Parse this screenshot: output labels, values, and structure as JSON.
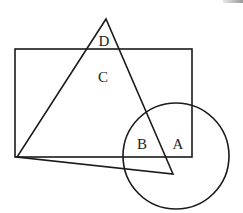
{
  "diagram": {
    "type": "venn-geometric-shapes",
    "stroke_color": "#1a1a1a",
    "background": "#ffffff",
    "shapes": {
      "rectangle": {
        "x": 15,
        "y": 49,
        "width": 177,
        "height": 108
      },
      "triangle": {
        "points": "106,19 17,157 173,174"
      },
      "circle": {
        "cx": 176,
        "cy": 156,
        "r": 53
      }
    },
    "labels": {
      "A": {
        "text": "A",
        "x": 178,
        "y": 149
      },
      "B": {
        "text": "B",
        "x": 142,
        "y": 149
      },
      "C": {
        "text": "C",
        "x": 103,
        "y": 82
      },
      "D": {
        "text": "D",
        "x": 104,
        "y": 46
      }
    }
  }
}
